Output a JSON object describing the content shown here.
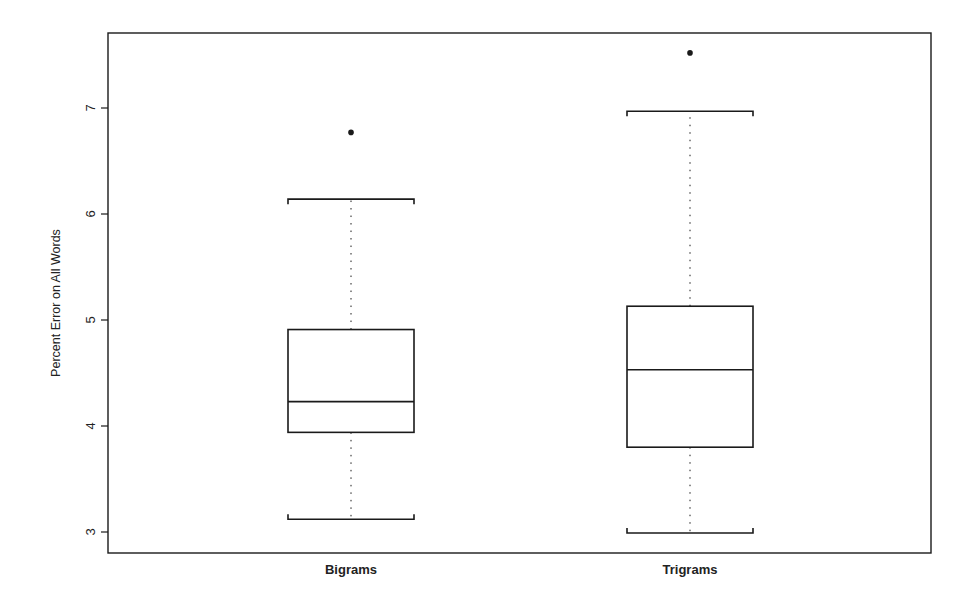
{
  "chart_data": {
    "type": "boxplot",
    "title": "",
    "xlabel": "",
    "ylabel": "Percent Error on All Words",
    "ylim": [
      2.8,
      7.7
    ],
    "yticks": [
      3,
      4,
      5,
      6,
      7
    ],
    "ytick_labels": [
      "3",
      "4",
      "5",
      "6",
      "7"
    ],
    "grid": false,
    "legend": null,
    "categories": [
      "Bigrams",
      "Trigrams"
    ],
    "series": [
      {
        "name": "Bigrams",
        "whisker_low": 3.12,
        "q1": 3.94,
        "median": 4.23,
        "q3": 4.91,
        "whisker_high": 6.14,
        "outliers": [
          6.77
        ]
      },
      {
        "name": "Trigrams",
        "whisker_low": 2.99,
        "q1": 3.8,
        "median": 4.53,
        "q3": 5.13,
        "whisker_high": 6.97,
        "outliers": [
          7.52
        ]
      }
    ]
  },
  "colors": {
    "line": "#1a1a1a",
    "background": "#ffffff"
  }
}
